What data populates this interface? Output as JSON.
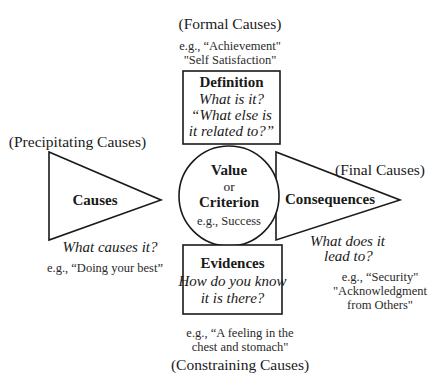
{
  "diagram": {
    "top": {
      "cause_type": "(Formal Causes)",
      "example_line1": "e.g., “Achievement\"",
      "example_line2": "\"Self Satisfaction\"",
      "box_title": "Definition",
      "question_line1": "What is it?",
      "question_line2": "“What else is",
      "question_line3": "it related to?”"
    },
    "center": {
      "title_line1": "Value",
      "connector": "or",
      "title_line2": "Criterion",
      "example": "e.g., Success"
    },
    "left": {
      "cause_type": "(Precipitating Causes)",
      "triangle_label": "Causes",
      "question": "What causes it?",
      "example": "e.g., “Doing your best”"
    },
    "right": {
      "cause_type": "(Final Causes)",
      "triangle_label": "Consequences",
      "question_line1": "What does it",
      "question_line2": "lead to?",
      "example_line1": "e.g., “Security\"",
      "example_line2": "\"Acknowledgment",
      "example_line3": "from Others\""
    },
    "bottom": {
      "box_title": "Evidences",
      "question_line1": "How do you know",
      "question_line2": "it is there?",
      "example_line1": "e.g., “A feeling in the",
      "example_line2": "chest and stomach\"",
      "cause_type": "(Constraining Causes)"
    },
    "colors": {
      "stroke": "#1a1a1a",
      "background": "#ffffff"
    }
  }
}
